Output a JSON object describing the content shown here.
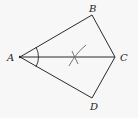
{
  "diagram": {
    "type": "geometry-construction",
    "points": {
      "A": {
        "label": "A",
        "x": 20,
        "y": 57
      },
      "B": {
        "label": "B",
        "x": 92,
        "y": 15
      },
      "C": {
        "label": "C",
        "x": 115,
        "y": 57
      },
      "D": {
        "label": "D",
        "x": 92,
        "y": 98
      }
    },
    "segments": [
      "AB",
      "BC",
      "CD",
      "DA",
      "AC"
    ],
    "marks": [
      "angle-arc-at-A",
      "construction-arcs-on-AC"
    ],
    "colors": {
      "line": "#2a2a2a",
      "construction": "#666666",
      "background": "#f7f7f7"
    }
  }
}
